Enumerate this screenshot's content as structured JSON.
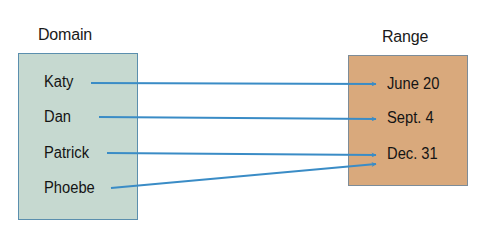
{
  "diagram": {
    "type": "mapping",
    "domain": {
      "title": "Domain",
      "items": [
        "Katy",
        "Dan",
        "Patrick",
        "Phoebe"
      ],
      "fill": "#c6d9d0"
    },
    "range": {
      "title": "Range",
      "items": [
        "June 20",
        "Sept. 4",
        "Dec. 31"
      ],
      "fill": "#d9a97c"
    },
    "mappings": [
      {
        "from": "Katy",
        "to": "June 20"
      },
      {
        "from": "Dan",
        "to": "Sept. 4"
      },
      {
        "from": "Patrick",
        "to": "Dec. 31"
      },
      {
        "from": "Phoebe",
        "to": "Dec. 31"
      }
    ],
    "arrow_color": "#3a8cc6"
  }
}
